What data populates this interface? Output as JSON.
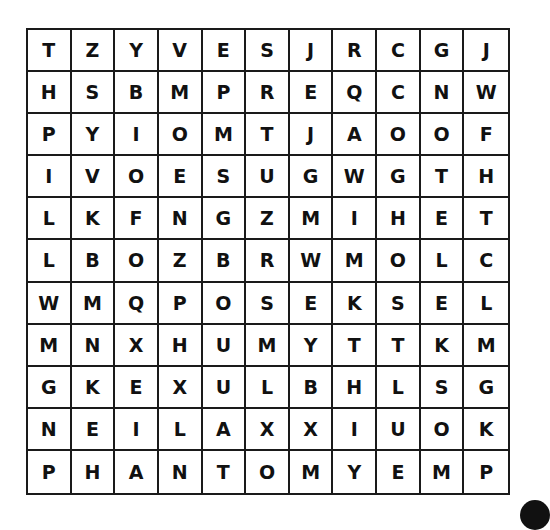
{
  "puzzle": {
    "type": "word-search",
    "rows": 11,
    "cols": 11,
    "grid": [
      [
        "T",
        "Z",
        "Y",
        "V",
        "E",
        "S",
        "J",
        "R",
        "C",
        "G",
        "J"
      ],
      [
        "H",
        "S",
        "B",
        "M",
        "P",
        "R",
        "E",
        "Q",
        "C",
        "N",
        "W"
      ],
      [
        "P",
        "Y",
        "I",
        "O",
        "M",
        "T",
        "J",
        "A",
        "O",
        "O",
        "F"
      ],
      [
        "I",
        "V",
        "O",
        "E",
        "S",
        "U",
        "G",
        "W",
        "G",
        "T",
        "H"
      ],
      [
        "L",
        "K",
        "F",
        "N",
        "G",
        "Z",
        "M",
        "I",
        "H",
        "E",
        "T"
      ],
      [
        "L",
        "B",
        "O",
        "Z",
        "B",
        "R",
        "W",
        "M",
        "O",
        "L",
        "C"
      ],
      [
        "W",
        "M",
        "Q",
        "P",
        "O",
        "S",
        "E",
        "K",
        "S",
        "E",
        "L"
      ],
      [
        "M",
        "N",
        "X",
        "H",
        "U",
        "M",
        "Y",
        "T",
        "T",
        "K",
        "M"
      ],
      [
        "G",
        "K",
        "E",
        "X",
        "U",
        "L",
        "B",
        "H",
        "L",
        "S",
        "G"
      ],
      [
        "N",
        "E",
        "I",
        "L",
        "A",
        "X",
        "X",
        "I",
        "U",
        "O",
        "K"
      ],
      [
        "P",
        "H",
        "A",
        "N",
        "T",
        "O",
        "M",
        "Y",
        "E",
        "M",
        "P"
      ]
    ]
  },
  "colors": {
    "grid_line": "#1a1a1a",
    "letter": "#111111",
    "background": "#ffffff"
  }
}
